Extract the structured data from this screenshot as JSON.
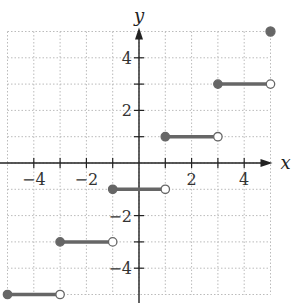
{
  "chart_data": {
    "type": "line",
    "subtype": "step-function",
    "title": "",
    "xlabel": "x",
    "ylabel": "y",
    "xlim": [
      -5,
      5
    ],
    "ylim": [
      -5,
      5
    ],
    "grid": true,
    "x_ticks": [
      -4,
      -2,
      2,
      4
    ],
    "y_ticks": [
      4,
      2,
      -2,
      -4
    ],
    "x_tick_labels": [
      "−4",
      "−2",
      "2",
      "4"
    ],
    "y_tick_labels": [
      "4",
      "2",
      "−2",
      "−4"
    ],
    "segments": [
      {
        "x_start": -5,
        "x_end": -3,
        "y": -5,
        "start": "closed",
        "end": "open"
      },
      {
        "x_start": -3,
        "x_end": -1,
        "y": -3,
        "start": "closed",
        "end": "open"
      },
      {
        "x_start": -1,
        "x_end": 1,
        "y": -1,
        "start": "closed",
        "end": "open"
      },
      {
        "x_start": 1,
        "x_end": 3,
        "y": 1,
        "start": "closed",
        "end": "open"
      },
      {
        "x_start": 3,
        "x_end": 5,
        "y": 3,
        "start": "closed",
        "end": "open"
      }
    ],
    "points": [
      {
        "x": 5,
        "y": 5,
        "style": "closed"
      }
    ],
    "colors": {
      "line": "#666666",
      "grid": "#bbbbbb",
      "axis": "#222222"
    }
  }
}
